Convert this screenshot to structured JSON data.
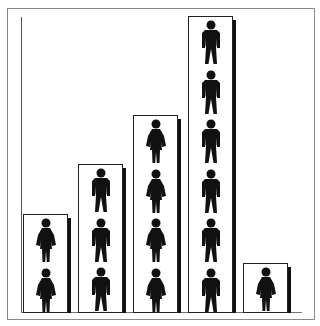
{
  "chart_data": {
    "type": "bar",
    "subtype": "pictograph",
    "title": "",
    "xlabel": "",
    "ylabel": "",
    "categories": [
      "1",
      "2",
      "3",
      "4",
      "5"
    ],
    "values": [
      2,
      3,
      4,
      6,
      1
    ],
    "icon_per_unit": [
      "female-figure",
      "male-figure",
      "female-figure",
      "male-figure",
      "female-figure"
    ],
    "ylim": [
      0,
      6
    ],
    "grid": false,
    "legend": null
  },
  "colors": {
    "figure": "#111111",
    "bar_border": "#222222",
    "shadow": "#111111",
    "background": "#ffffff"
  }
}
